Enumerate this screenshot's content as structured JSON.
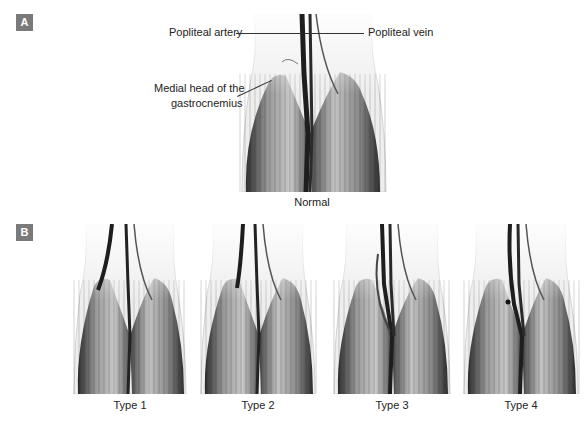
{
  "figure": {
    "panel_a": {
      "badge": "A",
      "caption": "Normal",
      "labels": {
        "popliteal_artery": "Popliteal artery",
        "popliteal_vein": "Popliteal vein",
        "medial_head_line1": "Medial head of the",
        "medial_head_line2": "gastrocnemius"
      }
    },
    "panel_b": {
      "badge": "B",
      "variants": [
        {
          "caption": "Type 1"
        },
        {
          "caption": "Type 2"
        },
        {
          "caption": "Type 3"
        },
        {
          "caption": "Type 4"
        }
      ]
    },
    "colors": {
      "badge_bg": "#7a7a7a",
      "muscle_dark": "#3a3a3a",
      "vessel": "#1e1e1e",
      "skin": "#e6e6e6"
    }
  }
}
